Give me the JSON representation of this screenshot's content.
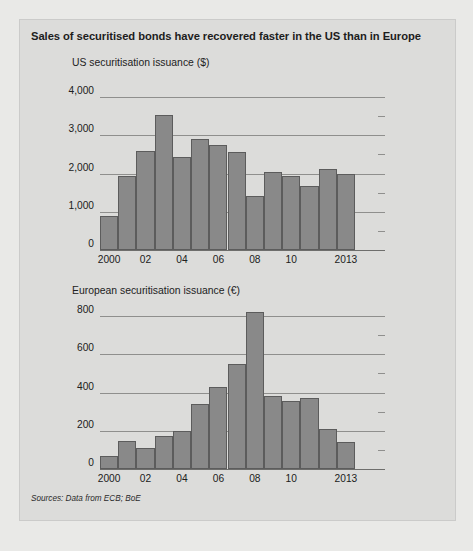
{
  "figure": {
    "title": "Sales of securitised bonds have recovered faster in the US than in Europe",
    "source_note": "Sources: Data from ECB; BoE",
    "bar_color": "#898989",
    "bar_edge_color": "#5c5c5c",
    "panel_color": "#dcdcda",
    "background_color": "#e9e9e7",
    "gridline_color": "#8f8f8d"
  },
  "chart_data": [
    {
      "type": "bar",
      "title": "US securitisation issuance ($)",
      "xlabel": "",
      "ylabel": "",
      "ylim": [
        0,
        4000
      ],
      "yticks": [
        0,
        1000,
        2000,
        3000,
        4000
      ],
      "ytick_labels": [
        "0",
        "1,000",
        "2,000",
        "3,000",
        "4,000"
      ],
      "grid": true,
      "legend": "none",
      "categories": [
        "2000",
        "2001",
        "2002",
        "2003",
        "2004",
        "2005",
        "2006",
        "2007",
        "2008",
        "2009",
        "2010",
        "2011",
        "2012",
        "2013"
      ],
      "xtick_labels": [
        "2000",
        "02",
        "04",
        "06",
        "08",
        "10",
        "2013"
      ],
      "xtick_categories": [
        "2000",
        "2002",
        "2004",
        "2006",
        "2008",
        "2010",
        "2013"
      ],
      "values": [
        880,
        1930,
        2580,
        3520,
        2430,
        2900,
        2740,
        2570,
        1400,
        2050,
        1930,
        1680,
        2110,
        2000
      ]
    },
    {
      "type": "bar",
      "title": "European securitisation issuance (€)",
      "xlabel": "",
      "ylabel": "",
      "ylim": [
        0,
        800
      ],
      "yticks": [
        0,
        200,
        400,
        600,
        800
      ],
      "ytick_labels": [
        "0",
        "200",
        "400",
        "600",
        "800"
      ],
      "grid": true,
      "legend": "none",
      "categories": [
        "2000",
        "2001",
        "2002",
        "2003",
        "2004",
        "2005",
        "2006",
        "2007",
        "2008",
        "2009",
        "2010",
        "2011",
        "2012",
        "2013"
      ],
      "xtick_labels": [
        "2000",
        "02",
        "04",
        "06",
        "08",
        "10",
        "2013"
      ],
      "xtick_categories": [
        "2000",
        "2002",
        "2004",
        "2006",
        "2008",
        "2010",
        "2013"
      ],
      "values": [
        70,
        145,
        110,
        170,
        200,
        340,
        430,
        550,
        820,
        380,
        355,
        370,
        210,
        140
      ]
    }
  ]
}
